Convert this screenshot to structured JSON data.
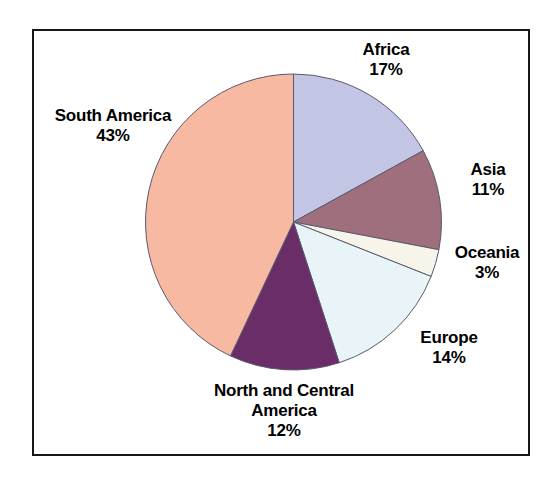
{
  "chart_data": {
    "type": "pie",
    "title": "",
    "subtitle": "",
    "xlabel": "",
    "ylabel": "",
    "legend_position": "none",
    "grid": false,
    "start_angle_deg": 0,
    "direction": "clockwise",
    "unit": "%",
    "categories": [
      "Africa",
      "Asia",
      "Oceania",
      "Europe",
      "North and Central America",
      "South America"
    ],
    "values": [
      17,
      11,
      3,
      14,
      12,
      43
    ],
    "slices": [
      {
        "label": "Africa",
        "label_line1": "Africa",
        "label_line2": "",
        "value": 17,
        "value_text": "17%",
        "color": "#c2c5e4"
      },
      {
        "label": "Asia",
        "label_line1": "Asia",
        "label_line2": "",
        "value": 11,
        "value_text": "11%",
        "color": "#9f6f7e"
      },
      {
        "label": "Oceania",
        "label_line1": "Oceania",
        "label_line2": "",
        "value": 3,
        "value_text": "3%",
        "color": "#f7f4ea"
      },
      {
        "label": "Europe",
        "label_line1": "Europe",
        "label_line2": "",
        "value": 14,
        "value_text": "14%",
        "color": "#e8f4f8"
      },
      {
        "label": "North and Central America",
        "label_line1": "North and Central",
        "label_line2": "America",
        "value": 12,
        "value_text": "12%",
        "color": "#6b2d68"
      },
      {
        "label": "South America",
        "label_line1": "South America",
        "label_line2": "",
        "value": 43,
        "value_text": "43%",
        "color": "#f7b9a1"
      }
    ]
  },
  "style": {
    "frame_border_color": "#161616",
    "background_color": "#ffffff",
    "slice_outline_color": "#5a5a6e",
    "label_text_color": "#000000"
  }
}
